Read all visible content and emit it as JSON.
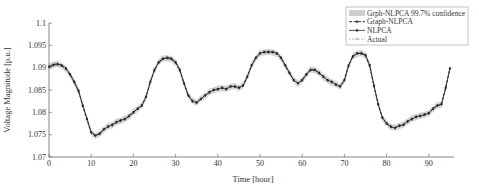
{
  "chart_data": {
    "type": "line",
    "title": "",
    "xlabel": "Time [hour]",
    "ylabel": "Voltage Magnitude [p.u.]",
    "xlim": [
      0,
      96
    ],
    "ylim": [
      1.07,
      1.1
    ],
    "xticks": [
      0,
      10,
      20,
      30,
      40,
      50,
      60,
      70,
      80,
      90
    ],
    "yticks": [
      1.07,
      1.075,
      1.08,
      1.085,
      1.09,
      1.095,
      1.1
    ],
    "ytick_labels": [
      "1.07",
      "1.075",
      "1.08",
      "1.085",
      "1.09",
      "1.095",
      "1.1"
    ],
    "grid": false,
    "legend_position": "upper right",
    "legend": [
      {
        "label": "Grph-NLPCA 99.7% confidence",
        "style": "band",
        "color": "#c8c8c8"
      },
      {
        "label": "Graph-NLPCA",
        "style": "dashed-marker",
        "color": "#222222"
      },
      {
        "label": "NLPCA",
        "style": "solid-square",
        "color": "#444444"
      },
      {
        "label": "Actual",
        "style": "dotted-circle",
        "color": "#999999"
      }
    ],
    "x": [
      0,
      1,
      2,
      3,
      4,
      5,
      6,
      7,
      8,
      9,
      10,
      11,
      12,
      13,
      14,
      15,
      16,
      17,
      18,
      19,
      20,
      21,
      22,
      23,
      24,
      25,
      26,
      27,
      28,
      29,
      30,
      31,
      32,
      33,
      34,
      35,
      36,
      37,
      38,
      39,
      40,
      41,
      42,
      43,
      44,
      45,
      46,
      47,
      48,
      49,
      50,
      51,
      52,
      53,
      54,
      55,
      56,
      57,
      58,
      59,
      60,
      61,
      62,
      63,
      64,
      65,
      66,
      67,
      68,
      69,
      70,
      71,
      72,
      73,
      74,
      75,
      76,
      77,
      78,
      79,
      80,
      81,
      82,
      83,
      84,
      85,
      86,
      87,
      88,
      89,
      90,
      91,
      92,
      93,
      94,
      95
    ],
    "series": [
      {
        "name": "Actual",
        "values": [
          1.0902,
          1.0906,
          1.0908,
          1.0905,
          1.0898,
          1.0885,
          1.0868,
          1.0848,
          1.0815,
          1.0785,
          1.0755,
          1.0748,
          1.0752,
          1.0762,
          1.0768,
          1.0772,
          1.0778,
          1.0782,
          1.0785,
          1.0792,
          1.08,
          1.0808,
          1.0815,
          1.0835,
          1.0868,
          1.0895,
          1.0912,
          1.092,
          1.0922,
          1.092,
          1.0912,
          1.0895,
          1.0865,
          1.0838,
          1.0825,
          1.0822,
          1.083,
          1.0838,
          1.0845,
          1.085,
          1.0852,
          1.0855,
          1.0852,
          1.0858,
          1.0858,
          1.0855,
          1.086,
          1.088,
          1.0905,
          1.0922,
          1.0932,
          1.0935,
          1.0935,
          1.0935,
          1.0932,
          1.0922,
          1.0905,
          1.0888,
          1.0872,
          1.0865,
          1.0872,
          1.0885,
          1.0895,
          1.0895,
          1.0888,
          1.088,
          1.0872,
          1.0868,
          1.0862,
          1.0858,
          1.0872,
          1.0905,
          1.0925,
          1.0932,
          1.0932,
          1.0928,
          1.0905,
          1.086,
          1.0818,
          1.0788,
          1.0775,
          1.0768,
          1.0765,
          1.077,
          1.0772,
          1.078,
          1.0785,
          1.079,
          1.0792,
          1.0795,
          1.0798,
          1.0808,
          1.0815,
          1.0818,
          1.0855,
          1.0898
        ]
      },
      {
        "name": "Graph-NLPCA",
        "values": [
          1.0903,
          1.0907,
          1.0909,
          1.0904,
          1.0897,
          1.0884,
          1.0867,
          1.0849,
          1.0814,
          1.0784,
          1.0754,
          1.0747,
          1.0753,
          1.0761,
          1.0769,
          1.0771,
          1.0779,
          1.0781,
          1.0786,
          1.0791,
          1.0801,
          1.0807,
          1.0816,
          1.0834,
          1.0869,
          1.0894,
          1.0913,
          1.0921,
          1.0921,
          1.0919,
          1.0911,
          1.0894,
          1.0864,
          1.0837,
          1.0826,
          1.0821,
          1.0831,
          1.0837,
          1.0846,
          1.0849,
          1.0853,
          1.0854,
          1.0853,
          1.0857,
          1.0859,
          1.0854,
          1.0861,
          1.0879,
          1.0906,
          1.0921,
          1.0933,
          1.0934,
          1.0936,
          1.0934,
          1.0931,
          1.0921,
          1.0904,
          1.0887,
          1.0873,
          1.0864,
          1.0873,
          1.0884,
          1.0896,
          1.0894,
          1.0889,
          1.0879,
          1.0873,
          1.0867,
          1.0863,
          1.0857,
          1.0873,
          1.0904,
          1.0926,
          1.0931,
          1.0933,
          1.0927,
          1.0904,
          1.0859,
          1.0819,
          1.0787,
          1.0776,
          1.0767,
          1.0766,
          1.0769,
          1.0773,
          1.0779,
          1.0786,
          1.0789,
          1.0793,
          1.0794,
          1.0799,
          1.0807,
          1.0816,
          1.0817,
          1.0856,
          1.0897
        ]
      },
      {
        "name": "NLPCA",
        "values": [
          1.0901,
          1.0905,
          1.0907,
          1.0906,
          1.0899,
          1.0886,
          1.0869,
          1.0847,
          1.0816,
          1.0786,
          1.0756,
          1.0749,
          1.0751,
          1.0763,
          1.0767,
          1.0773,
          1.0777,
          1.0783,
          1.0784,
          1.0793,
          1.0799,
          1.0809,
          1.0814,
          1.0836,
          1.0867,
          1.0896,
          1.0911,
          1.0919,
          1.0923,
          1.0921,
          1.0913,
          1.0896,
          1.0866,
          1.0839,
          1.0824,
          1.0823,
          1.0829,
          1.0839,
          1.0844,
          1.0851,
          1.0851,
          1.0856,
          1.0851,
          1.0859,
          1.0857,
          1.0856,
          1.0859,
          1.0881,
          1.0904,
          1.0923,
          1.0931,
          1.0936,
          1.0934,
          1.0936,
          1.0933,
          1.0923,
          1.0906,
          1.0889,
          1.0871,
          1.0866,
          1.0871,
          1.0886,
          1.0894,
          1.0896,
          1.0887,
          1.0881,
          1.0871,
          1.0869,
          1.0861,
          1.0859,
          1.0871,
          1.0906,
          1.0924,
          1.0933,
          1.0931,
          1.0929,
          1.0906,
          1.0861,
          1.0817,
          1.0789,
          1.0774,
          1.0769,
          1.0764,
          1.0771,
          1.0771,
          1.0781,
          1.0784,
          1.0791,
          1.0791,
          1.0796,
          1.0797,
          1.0809,
          1.0814,
          1.0819,
          1.0854,
          1.0899
        ]
      }
    ],
    "confidence_band_halfwidth": 0.0007
  }
}
